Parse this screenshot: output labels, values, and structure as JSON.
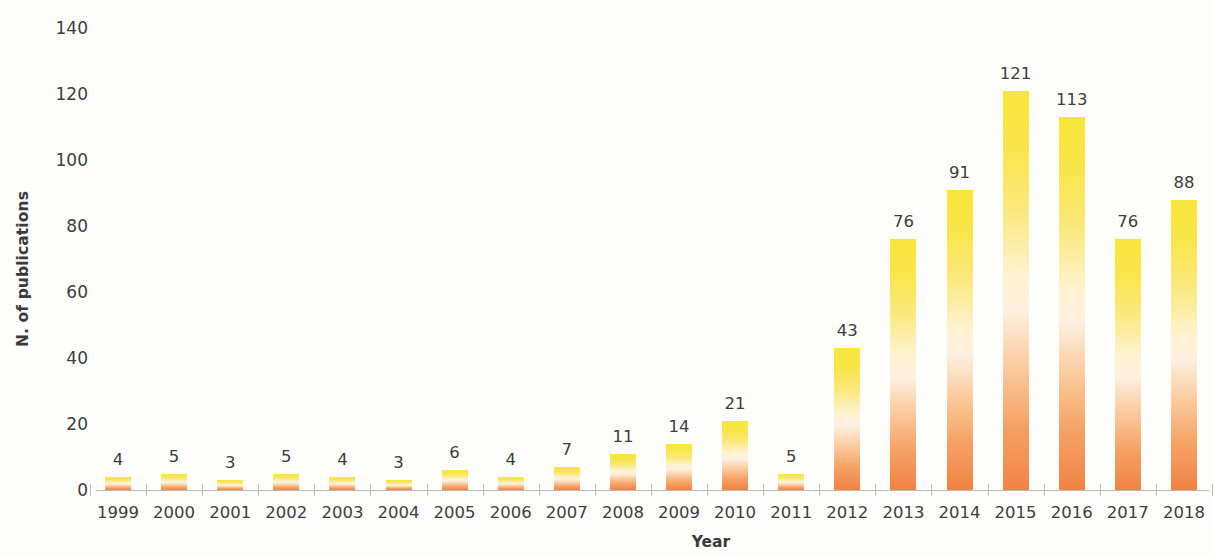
{
  "chart_data": {
    "type": "bar",
    "title": "",
    "xlabel": "Year",
    "ylabel": "N. of publications",
    "categories": [
      "1999",
      "2000",
      "2001",
      "2002",
      "2003",
      "2004",
      "2005",
      "2006",
      "2007",
      "2008",
      "2009",
      "2010",
      "2011",
      "2012",
      "2013",
      "2014",
      "2015",
      "2016",
      "2017",
      "2018"
    ],
    "values": [
      4,
      5,
      3,
      5,
      4,
      3,
      6,
      4,
      7,
      11,
      14,
      21,
      5,
      43,
      76,
      91,
      121,
      113,
      76,
      88
    ],
    "data_labels": [
      "4",
      "5",
      "3",
      "5",
      "4",
      "3",
      "6",
      "4",
      "7",
      "11",
      "14",
      "21",
      "5",
      "43",
      "76",
      "91",
      "121",
      "113",
      "76",
      "88"
    ],
    "ylim": [
      0,
      140
    ],
    "yticks": [
      0,
      20,
      40,
      60,
      80,
      100,
      120,
      140
    ],
    "ytick_labels": [
      "0",
      "20",
      "40",
      "60",
      "80",
      "100",
      "120",
      "140"
    ],
    "grid": false,
    "legend": null,
    "bar_gradient_top_color": "#f7e63a",
    "bar_gradient_bottom_color": "#f08344",
    "axis_color": "#b9b9b9",
    "text_color": "#3d3d3d",
    "background_color": "#fdfdfb"
  }
}
